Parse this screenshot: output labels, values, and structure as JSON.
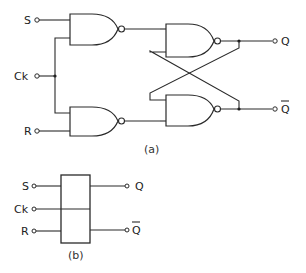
{
  "figure_a": {
    "caption": "(a)",
    "inputs": {
      "s": "S",
      "ck": "Ck",
      "r": "R"
    },
    "outputs": {
      "q": "Q",
      "qbar": "Q"
    },
    "gates": [
      "nand-input-s",
      "nand-input-r",
      "nand-latch-top",
      "nand-latch-bottom"
    ]
  },
  "figure_b": {
    "caption": "(b)",
    "inputs": {
      "s": "S",
      "ck": "Ck",
      "r": "R"
    },
    "outputs": {
      "q": "Q",
      "qbar": "Q"
    }
  },
  "colors": {
    "line": "#2a2a2a",
    "background": "#ffffff"
  }
}
